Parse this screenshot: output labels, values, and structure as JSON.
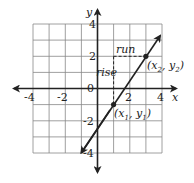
{
  "diagram": {
    "type": "coordinate-plane",
    "x_axis": {
      "label": "x",
      "ticks": [
        "-4",
        "-2",
        "0",
        "2",
        "4"
      ]
    },
    "y_axis": {
      "label": "y",
      "ticks": [
        "4",
        "2",
        "-2",
        "-4"
      ]
    },
    "grid": {
      "xmin": -4,
      "xmax": 4,
      "ymin": -4,
      "ymax": 4,
      "step": 1
    },
    "line": {
      "slope": 1.5,
      "intercept": -2.5,
      "from": [
        -1,
        -4
      ],
      "to": [
        4,
        3.5
      ]
    },
    "points": [
      {
        "id": "p1",
        "coord": [
          1,
          -1
        ],
        "label_main": "(x",
        "sub1": "1",
        "mid": ", y",
        "sub2": "1",
        "end": ")"
      },
      {
        "id": "p2",
        "coord": [
          3,
          2
        ],
        "label_main": "(x",
        "sub1": "2",
        "mid": ", y",
        "sub2": "2",
        "end": ")"
      }
    ],
    "annotations": {
      "run": "run",
      "rise": "rise"
    }
  }
}
